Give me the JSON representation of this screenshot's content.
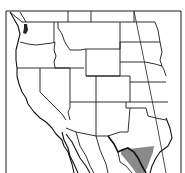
{
  "map": {
    "title": "Range map",
    "region": "Western United States and northern Mexico",
    "range_label": "Species range (south Texas / northeastern Mexico)",
    "colors": {
      "background": "#ffffff",
      "lines": "#1a1a1a",
      "range_fill": "#8a8a8a",
      "water_fill": "#222222"
    }
  }
}
